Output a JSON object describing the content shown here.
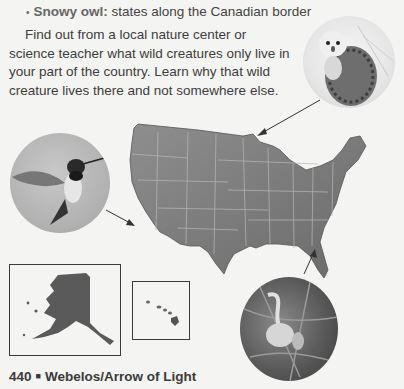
{
  "bullet": {
    "marker": "•",
    "term": "Snowy owl:",
    "text": " states along the Canadian border"
  },
  "paragraph": "Find out from a local nature center or science teacher what wild creatures only live in your part of the country. Learn why that wild creature lives there and not somewhere else.",
  "images": {
    "owl": "snowy-owl-photo",
    "hummingbird": "hummingbird-photo",
    "heron": "wading-bird-photo",
    "map": "us-states-map",
    "alaska": "alaska-inset",
    "hawaii": "hawaii-inset"
  },
  "footer": {
    "page_number": "440",
    "separator": "■",
    "title": "Webelos/Arrow of Light"
  }
}
